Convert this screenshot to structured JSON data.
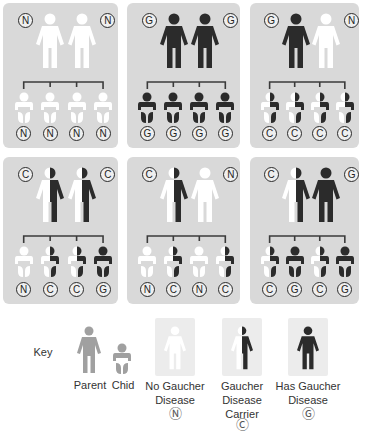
{
  "colors": {
    "panel_bg": "#d9d9d9",
    "normal": "#ffffff",
    "disease": "#2b2b2b",
    "key_gray": "#a0a0a0",
    "key_box": "#ececec"
  },
  "panels": [
    {
      "parents": [
        "N",
        "N"
      ],
      "children": [
        "N",
        "N",
        "N",
        "N"
      ]
    },
    {
      "parents": [
        "G",
        "G"
      ],
      "children": [
        "G",
        "G",
        "G",
        "G"
      ]
    },
    {
      "parents": [
        "G",
        "N"
      ],
      "children": [
        "C",
        "C",
        "C",
        "C"
      ]
    },
    {
      "parents": [
        "C",
        "C"
      ],
      "children": [
        "N",
        "C",
        "C",
        "G"
      ]
    },
    {
      "parents": [
        "C",
        "N"
      ],
      "children": [
        "N",
        "C",
        "N",
        "C"
      ]
    },
    {
      "parents": [
        "C",
        "G"
      ],
      "children": [
        "C",
        "G",
        "C",
        "G"
      ]
    }
  ],
  "key": {
    "title": "Key",
    "parent_label": "Parent",
    "child_label": "Chid",
    "items": [
      {
        "status": "N",
        "line1": "No Gaucher",
        "line2": "Disease",
        "line3": "",
        "symbol": "Ⓝ"
      },
      {
        "status": "C",
        "line1": "Gaucher",
        "line2": "Disease",
        "line3": "Carrier",
        "symbol": "Ⓒ"
      },
      {
        "status": "G",
        "line1": "Has Gaucher",
        "line2": "Disease",
        "line3": "",
        "symbol": "Ⓖ"
      }
    ]
  }
}
